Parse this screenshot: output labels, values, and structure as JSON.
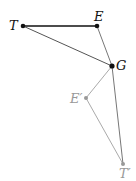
{
  "diagram": {
    "points": {
      "T": {
        "label": "T",
        "x": 23,
        "y": 26,
        "color": "#111111"
      },
      "E": {
        "label": "E",
        "x": 97,
        "y": 26,
        "color": "#111111"
      },
      "G": {
        "label": "G",
        "x": 112,
        "y": 66,
        "color": "#111111"
      },
      "E2": {
        "label": "E′",
        "x": 86,
        "y": 98,
        "color": "#999999"
      },
      "T2": {
        "label": "T′",
        "x": 123,
        "y": 164,
        "color": "#999999"
      }
    },
    "segments": [
      {
        "from": "T",
        "to": "E",
        "color": "#111111",
        "width": 1.6
      },
      {
        "from": "T",
        "to": "G",
        "color": "#555555",
        "width": 1
      },
      {
        "from": "E",
        "to": "G",
        "color": "#777777",
        "width": 1
      },
      {
        "from": "G",
        "to": "E2",
        "color": "#aaaaaa",
        "width": 1
      },
      {
        "from": "E2",
        "to": "T2",
        "color": "#aaaaaa",
        "width": 1
      },
      {
        "from": "G",
        "to": "T2",
        "color": "#777777",
        "width": 1
      }
    ]
  }
}
